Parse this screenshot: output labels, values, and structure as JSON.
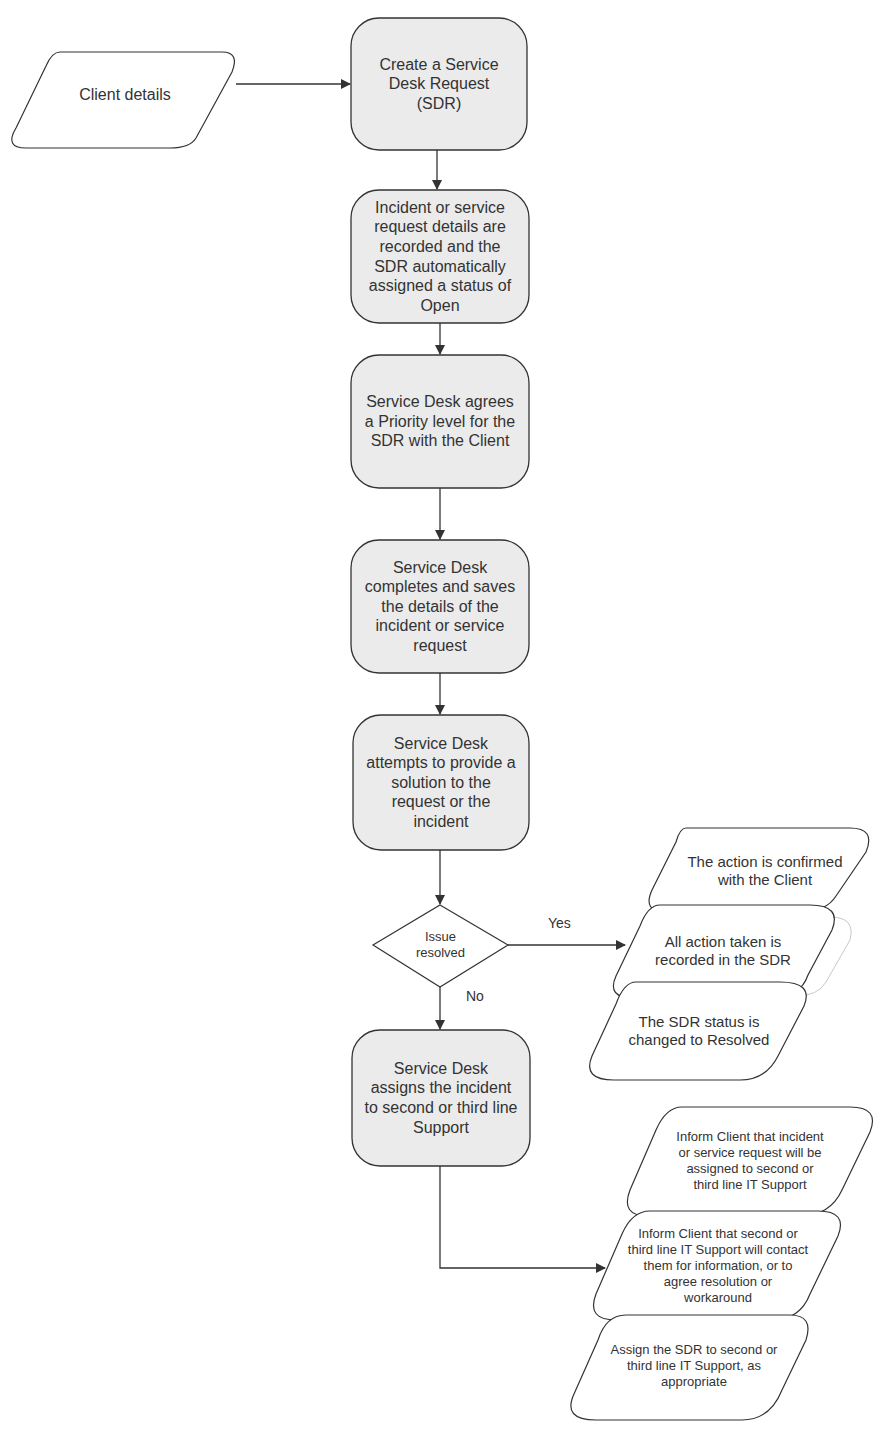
{
  "diagram": {
    "type": "flowchart",
    "nodes": [
      {
        "id": "client-details",
        "shape": "data",
        "label": "Client details"
      },
      {
        "id": "create-sdr",
        "shape": "process",
        "label": "Create a Service\nDesk Request\n(SDR)"
      },
      {
        "id": "record-details",
        "shape": "process",
        "label": "Incident or service\nrequest details are\nrecorded and the\nSDR automatically\nassigned a status of\nOpen"
      },
      {
        "id": "agree-priority",
        "shape": "process",
        "label": "Service Desk agrees\na Priority level for the\nSDR with the Client"
      },
      {
        "id": "complete-save",
        "shape": "process",
        "label": "Service Desk\ncompletes and saves\nthe details of the\nincident or service\nrequest"
      },
      {
        "id": "attempt-solution",
        "shape": "process",
        "label": "Service Desk\nattempts to provide a\nsolution to the\nrequest or the\nincident"
      },
      {
        "id": "issue-resolved",
        "shape": "decision",
        "label": "Issue\nresolved"
      },
      {
        "id": "assign-support",
        "shape": "process",
        "label": "Service Desk\nassigns the incident\nto second or third line\nSupport"
      },
      {
        "id": "confirm-client",
        "shape": "data",
        "label": "The action is confirmed\nwith the Client"
      },
      {
        "id": "record-action",
        "shape": "data",
        "label": "All action taken is\nrecorded in the SDR"
      },
      {
        "id": "status-resolved",
        "shape": "data",
        "label": "The SDR status is\nchanged to Resolved"
      },
      {
        "id": "inform-assigned",
        "shape": "data",
        "label": "Inform Client that  incident\nor service request will be\nassigned to second or\nthird line IT Support"
      },
      {
        "id": "inform-contact",
        "shape": "data",
        "label": "Inform Client that second or\nthird line IT Support will contact\nthem for information, or to\nagree resolution or\nworkaround"
      },
      {
        "id": "assign-sdr",
        "shape": "data",
        "label": "Assign the SDR to second or\nthird line IT Support, as\nappropriate"
      }
    ],
    "edges": [
      {
        "from": "client-details",
        "to": "create-sdr",
        "label": ""
      },
      {
        "from": "create-sdr",
        "to": "record-details",
        "label": ""
      },
      {
        "from": "record-details",
        "to": "agree-priority",
        "label": ""
      },
      {
        "from": "agree-priority",
        "to": "complete-save",
        "label": ""
      },
      {
        "from": "complete-save",
        "to": "attempt-solution",
        "label": ""
      },
      {
        "from": "attempt-solution",
        "to": "issue-resolved",
        "label": ""
      },
      {
        "from": "issue-resolved",
        "to": "record-action",
        "label": "Yes"
      },
      {
        "from": "issue-resolved",
        "to": "assign-support",
        "label": "No"
      },
      {
        "from": "assign-support",
        "to": "inform-contact",
        "label": ""
      }
    ],
    "edge_labels": {
      "yes": "Yes",
      "no": "No"
    }
  }
}
